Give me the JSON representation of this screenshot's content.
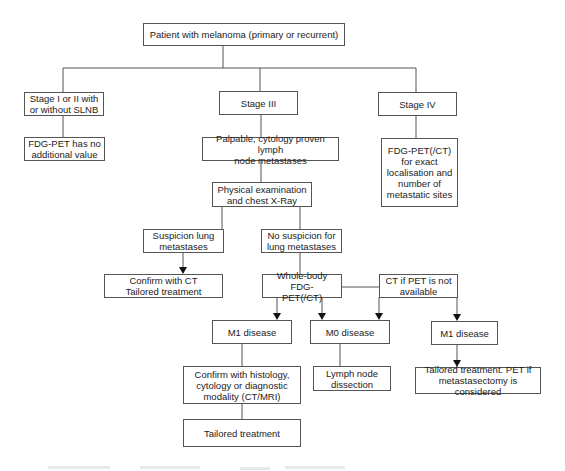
{
  "diagram": {
    "nodes": {
      "root": "Patient with melanoma (primary or recurrent)",
      "stage12": "Stage I or II with\nor without SLNB",
      "stage3": "Stage III",
      "stage4": "Stage IV",
      "no_value": "FDG-PET has no\nadditional value",
      "palpable": "Palpable, cytology proven lymph\nnode metastases",
      "stage4_pet": "FDG-PET(/CT)\nfor exact\nlocalisation and\nnumber of\nmetastatic sites",
      "physical": "Physical examination\nand chest X-Ray",
      "suspicion": "Suspicion lung\nmetastases",
      "no_suspicion": "No suspicion for\nlung metastases",
      "confirm_ct": "Confirm with CT\nTailored treatment",
      "whole_body": "Whole-body FDG-\nPET(/CT)",
      "ct_if_no_pet": "CT if PET is not\navailable",
      "m1_left": "M1 disease",
      "m0": "M0 disease",
      "m1_right": "M1 disease",
      "confirm_histology": "Confirm with histology,\ncytology or diagnostic\nmodality (CT/MRI)",
      "lymph_dissection": "Lymph node\ndissection",
      "tailored_pet": "Tailored treatment. PET if\nmetastasectomy is considered",
      "tailored": "Tailored treatment"
    },
    "edges": [
      [
        "root",
        "stage12"
      ],
      [
        "root",
        "stage3"
      ],
      [
        "root",
        "stage4"
      ],
      [
        "stage12",
        "no_value"
      ],
      [
        "stage3",
        "palpable"
      ],
      [
        "stage4",
        "stage4_pet"
      ],
      [
        "palpable",
        "physical"
      ],
      [
        "physical",
        "suspicion"
      ],
      [
        "physical",
        "no_suspicion"
      ],
      [
        "suspicion",
        "confirm_ct"
      ],
      [
        "no_suspicion",
        "whole_body"
      ],
      [
        "whole_body",
        "ct_if_no_pet"
      ],
      [
        "whole_body",
        "m1_left"
      ],
      [
        "whole_body",
        "m0"
      ],
      [
        "ct_if_no_pet",
        "m0"
      ],
      [
        "ct_if_no_pet",
        "m1_right"
      ],
      [
        "m1_left",
        "confirm_histology"
      ],
      [
        "m0",
        "lymph_dissection"
      ],
      [
        "m1_right",
        "tailored_pet"
      ],
      [
        "confirm_histology",
        "tailored"
      ]
    ],
    "colors": {
      "line": "#555555",
      "text": "#222222",
      "background": "#ffffff"
    }
  }
}
